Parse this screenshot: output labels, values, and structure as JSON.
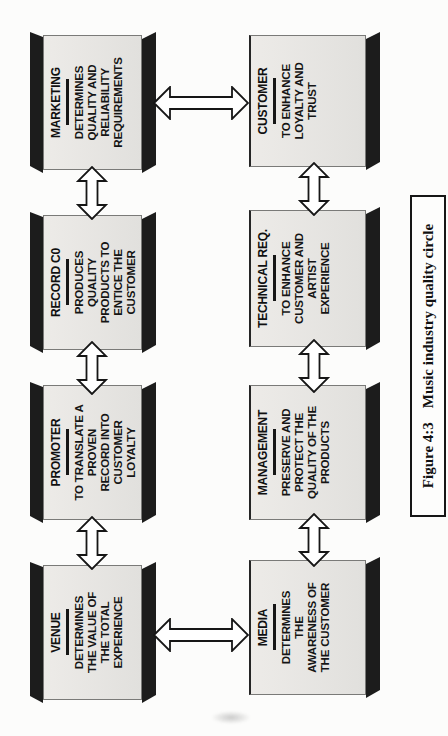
{
  "figure": {
    "caption": {
      "label": "Figure 4:3",
      "title": "Music industry quality circle"
    },
    "boxes": {
      "venue": {
        "title": "VENUE",
        "lines": [
          "DETERMINES",
          "THE VALUE OF",
          "THE TOTAL",
          "EXPERIENCE"
        ]
      },
      "promoter": {
        "title": "PROMOTER",
        "lines": [
          "TO TRANSLATE A",
          "PROVEN",
          "RECORD INTO",
          "CUSTOMER",
          "LOYALTY"
        ]
      },
      "record_co": {
        "title": "RECORD C0",
        "lines": [
          "PRODUCES",
          "QUALITY",
          "PRODUCTS TO",
          "ENTICE THE",
          "CUSTOMER"
        ]
      },
      "marketing": {
        "title": "MARKETING",
        "lines": [
          "DETERMINES",
          "QUALITY AND",
          "RELIABILITY",
          "REQUIREMENTS"
        ]
      },
      "media": {
        "title": "MEDIA",
        "lines": [
          "DETERMINES",
          "THE",
          "AWARENESS OF",
          "THE CUSTOMER"
        ]
      },
      "management": {
        "title": "MANAGEMENT",
        "lines": [
          "PRESERVE AND",
          "PROTECT THE",
          "QUALITY OF THE",
          "PRODUCTS"
        ]
      },
      "technical_req": {
        "title": "TECHNICAL REQ.",
        "lines": [
          "TO ENHANCE",
          "CUSTOMER AND",
          "ARTIST",
          "EXPERIENCE"
        ]
      },
      "customer": {
        "title": "CUSTOMER",
        "lines": [
          "TO ENHANCE",
          "LOYALTY AND",
          "TRUST"
        ]
      }
    },
    "colors": {
      "box_face": "#e7e5e2",
      "box_edge_band": "#1c1c1c",
      "paper": "#fcfcfb",
      "ink": "#111111"
    }
  }
}
